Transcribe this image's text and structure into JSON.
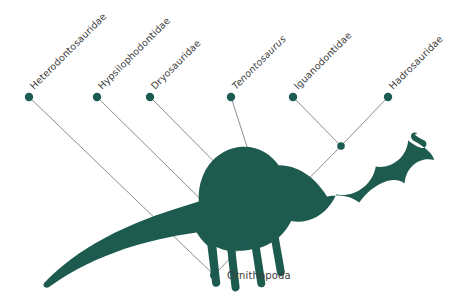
{
  "figure": {
    "type": "cladogram",
    "background_color": "#ffffff",
    "node_color": "#1c5b51",
    "branch_color": "#8d8d8d",
    "label_color": "#3b3b3b",
    "silhouette_color": "#1e5b4f",
    "silhouette_name": "parasaurolophus-silhouette"
  },
  "tree": {
    "root": {
      "id": "ornithopoda",
      "label": "Ornithopoda",
      "x": 214,
      "y": 275
    },
    "tips": [
      {
        "id": "heterodontosauridae",
        "label": "Heterodontosauridae",
        "x": 29,
        "y": 97,
        "italic": false
      },
      {
        "id": "hypsilophodontidae",
        "label": "Hypsilophodontidae",
        "x": 97,
        "y": 97,
        "italic": false
      },
      {
        "id": "dryosauridae",
        "label": "Dryosauridae",
        "x": 150,
        "y": 97,
        "italic": false
      },
      {
        "id": "tenontosaurus",
        "label": "Tenontosaurus",
        "x": 231,
        "y": 97,
        "italic": true
      },
      {
        "id": "iguanodontidae",
        "label": "Iguanodontidae",
        "x": 293,
        "y": 97,
        "italic": false
      },
      {
        "id": "hadrosauridae",
        "label": "Hadrosauridae",
        "x": 388,
        "y": 97,
        "italic": false
      }
    ],
    "internal_nodes": [
      {
        "id": "node-hadrosauriformes",
        "x": 341,
        "y": 146
      },
      {
        "id": "node-iguanodontia",
        "x": 270,
        "y": 218
      },
      {
        "id": "node-euornithopoda",
        "x": 245,
        "y": 243
      }
    ],
    "branches": [
      {
        "from": "heterodontosauridae",
        "x1": 29,
        "y1": 97,
        "x2": 214,
        "y2": 275
      },
      {
        "from": "hypsilophodontidae",
        "x1": 97,
        "y1": 97,
        "x2": 245,
        "y2": 243
      },
      {
        "from": "dryosauridae",
        "x1": 150,
        "y1": 97,
        "x2": 270,
        "y2": 218
      },
      {
        "from": "tenontosaurus",
        "x1": 231,
        "y1": 97,
        "x2": 270,
        "y2": 218
      },
      {
        "from": "iguanodontidae",
        "x1": 293,
        "y1": 97,
        "x2": 341,
        "y2": 146
      },
      {
        "from": "hadrosauridae",
        "x1": 388,
        "y1": 97,
        "x2": 341,
        "y2": 146
      },
      {
        "from": "node-hadrosauriformes",
        "x1": 341,
        "y1": 146,
        "x2": 270,
        "y2": 218
      },
      {
        "from": "node-iguanodontia",
        "x1": 270,
        "y1": 218,
        "x2": 245,
        "y2": 243
      },
      {
        "from": "node-euornithopoda",
        "x1": 245,
        "y1": 243,
        "x2": 214,
        "y2": 275
      }
    ],
    "label_rotation_deg": -45,
    "tip_dot_radius": 4.2,
    "internal_dot_radius": 3.8
  }
}
